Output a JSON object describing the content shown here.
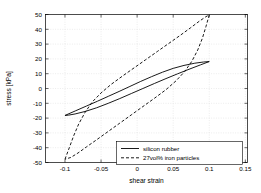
{
  "chart_data": {
    "type": "line",
    "title": "",
    "xlabel": "shear strain",
    "ylabel": "stress [kPa]",
    "xlim": [
      -0.127,
      0.153
    ],
    "ylim": [
      -50,
      50
    ],
    "xticks": [
      -0.1,
      -0.05,
      0,
      0.05,
      0.1,
      0.15
    ],
    "xticklabels": [
      "-0.1",
      "-0.05",
      "0",
      "0.05",
      "0.1",
      "0.15"
    ],
    "yticks": [
      -50,
      -40,
      -30,
      -20,
      -10,
      0,
      10,
      20,
      30,
      40,
      50
    ],
    "yticklabels": [
      "-50",
      "-40",
      "-30",
      "-20",
      "-10",
      "0",
      "10",
      "20",
      "30",
      "40",
      "50"
    ],
    "grid": true,
    "legend_position": "lower right",
    "series": [
      {
        "name": "silicon rubber",
        "style": "solid",
        "color": "#000000",
        "description": "narrow hysteresis loop, peak stress about +18 kPa at strain +0.1 and about -18 kPa at strain -0.1",
        "loop_upper": [
          [
            -0.1,
            -18.2
          ],
          [
            -0.085,
            -15.0
          ],
          [
            -0.07,
            -11.8
          ],
          [
            -0.055,
            -8.6
          ],
          [
            -0.04,
            -5.3
          ],
          [
            -0.025,
            -2.0
          ],
          [
            -0.01,
            1.4
          ],
          [
            0.005,
            4.8
          ],
          [
            0.02,
            8.0
          ],
          [
            0.035,
            11.0
          ],
          [
            0.05,
            13.6
          ],
          [
            0.065,
            15.6
          ],
          [
            0.08,
            17.1
          ],
          [
            0.092,
            17.9
          ],
          [
            0.1,
            18.2
          ]
        ],
        "loop_lower": [
          [
            0.1,
            18.2
          ],
          [
            0.088,
            16.0
          ],
          [
            0.072,
            13.0
          ],
          [
            0.056,
            9.9
          ],
          [
            0.04,
            6.7
          ],
          [
            0.024,
            3.4
          ],
          [
            0.008,
            0.0
          ],
          [
            -0.008,
            -3.4
          ],
          [
            -0.024,
            -6.8
          ],
          [
            -0.04,
            -10.0
          ],
          [
            -0.056,
            -13.0
          ],
          [
            -0.072,
            -15.5
          ],
          [
            -0.086,
            -17.2
          ],
          [
            -0.095,
            -18.0
          ],
          [
            -0.1,
            -18.2
          ]
        ]
      },
      {
        "name": "27vol% iron particles",
        "style": "dashed",
        "color": "#000000",
        "description": "wide hysteresis loop, peak stress about +50 kPa at strain +0.1 and about -48 kPa at strain -0.1",
        "loop_upper": [
          [
            -0.1,
            -47.8
          ],
          [
            -0.094,
            -40.0
          ],
          [
            -0.088,
            -32.0
          ],
          [
            -0.081,
            -24.0
          ],
          [
            -0.072,
            -16.0
          ],
          [
            -0.062,
            -9.0
          ],
          [
            -0.05,
            -3.0
          ],
          [
            -0.036,
            2.8
          ],
          [
            -0.02,
            8.5
          ],
          [
            -0.004,
            14.0
          ],
          [
            0.012,
            19.5
          ],
          [
            0.028,
            25.0
          ],
          [
            0.044,
            30.5
          ],
          [
            0.06,
            36.0
          ],
          [
            0.074,
            41.0
          ],
          [
            0.086,
            45.4
          ],
          [
            0.095,
            48.4
          ],
          [
            0.1,
            49.8
          ]
        ],
        "loop_lower": [
          [
            0.1,
            49.8
          ],
          [
            0.0955,
            42.0
          ],
          [
            0.0905,
            34.0
          ],
          [
            0.084,
            26.0
          ],
          [
            0.076,
            18.5
          ],
          [
            0.066,
            11.5
          ],
          [
            0.054,
            5.2
          ],
          [
            0.04,
            -0.8
          ],
          [
            0.024,
            -6.6
          ],
          [
            0.008,
            -12.2
          ],
          [
            -0.008,
            -17.8
          ],
          [
            -0.024,
            -23.4
          ],
          [
            -0.04,
            -29.0
          ],
          [
            -0.056,
            -34.6
          ],
          [
            -0.07,
            -39.4
          ],
          [
            -0.082,
            -43.6
          ],
          [
            -0.092,
            -46.6
          ],
          [
            -0.1,
            -47.8
          ]
        ]
      }
    ]
  },
  "legend": {
    "entries": [
      {
        "label": "silicon rubber",
        "style": "solid"
      },
      {
        "label": "27vol% iron particles",
        "style": "dashed"
      }
    ]
  }
}
